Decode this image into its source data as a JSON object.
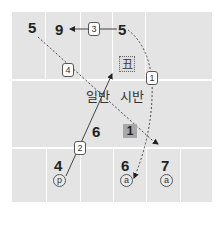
{
  "diagram": {
    "numbers": {
      "top_left": "5",
      "top_nine": "9",
      "top_five": "5",
      "mid_six": "6",
      "bot_four": "4",
      "bot_six": "6",
      "bot_seven": "7"
    },
    "steps": {
      "s1": "1",
      "s2": "2",
      "s3": "3",
      "s4": "4"
    },
    "labels": {
      "ilban": "일반",
      "siban": "시반",
      "chuk": "丑",
      "highlight": "1"
    },
    "circled": {
      "p": "p",
      "a1": "a",
      "a2": "a"
    },
    "colors": {
      "board": "#e4e4e4",
      "grid_line": "#ffffff",
      "highlight": "#a8a8a8"
    }
  }
}
